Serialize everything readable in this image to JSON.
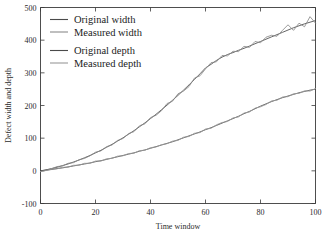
{
  "chart_data": {
    "type": "line",
    "title": "",
    "xlabel": "Time window",
    "ylabel": "Defect width and depth",
    "xlim": [
      0,
      100
    ],
    "ylim": [
      -100,
      500
    ],
    "xticks": [
      0,
      20,
      40,
      60,
      80,
      100
    ],
    "yticks": [
      -100,
      0,
      100,
      200,
      300,
      400,
      500
    ],
    "grid": false,
    "legend_position": "upper-left",
    "series": [
      {
        "name": "Original width",
        "color": "#4a4a4a",
        "x": [
          0,
          2,
          4,
          6,
          8,
          10,
          12,
          14,
          16,
          18,
          20,
          22,
          24,
          26,
          28,
          30,
          32,
          34,
          36,
          38,
          40,
          42,
          44,
          46,
          48,
          50,
          52,
          54,
          56,
          58,
          60,
          62,
          64,
          66,
          68,
          70,
          72,
          74,
          76,
          78,
          80,
          82,
          84,
          86,
          88,
          90,
          92,
          94,
          96,
          98,
          100
        ],
        "values": [
          0,
          3,
          7,
          11,
          16,
          21,
          27,
          33,
          40,
          47,
          55,
          63,
          72,
          81,
          91,
          101,
          112,
          123,
          135,
          147,
          160,
          173,
          187,
          201,
          216,
          231,
          247,
          263,
          280,
          297,
          315,
          326,
          338,
          348,
          356,
          362,
          369,
          375,
          382,
          389,
          396,
          403,
          410,
          417,
          424,
          431,
          438,
          444,
          450,
          455,
          460
        ]
      },
      {
        "name": "Measured width",
        "color": "#8a8a8a",
        "x": [
          0,
          2,
          4,
          6,
          8,
          10,
          12,
          14,
          16,
          18,
          20,
          22,
          24,
          26,
          28,
          30,
          32,
          34,
          36,
          38,
          40,
          42,
          44,
          46,
          48,
          50,
          52,
          54,
          56,
          58,
          60,
          62,
          64,
          66,
          68,
          70,
          72,
          74,
          76,
          78,
          80,
          82,
          84,
          86,
          88,
          90,
          92,
          94,
          96,
          98,
          100
        ],
        "values": [
          -2,
          2,
          6,
          13,
          15,
          23,
          25,
          34,
          38,
          46,
          57,
          61,
          74,
          79,
          93,
          99,
          114,
          120,
          138,
          144,
          163,
          170,
          184,
          206,
          213,
          236,
          244,
          258,
          284,
          291,
          312,
          331,
          334,
          353,
          352,
          366,
          365,
          381,
          378,
          396,
          392,
          409,
          415,
          412,
          430,
          447,
          430,
          452,
          441,
          472,
          452
        ]
      },
      {
        "name": "Original depth",
        "color": "#4a4a4a",
        "x": [
          0,
          2,
          4,
          6,
          8,
          10,
          12,
          14,
          16,
          18,
          20,
          22,
          24,
          26,
          28,
          30,
          32,
          34,
          36,
          38,
          40,
          42,
          44,
          46,
          48,
          50,
          52,
          54,
          56,
          58,
          60,
          62,
          64,
          66,
          68,
          70,
          72,
          74,
          76,
          78,
          80,
          82,
          84,
          86,
          88,
          90,
          92,
          94,
          96,
          98,
          100
        ],
        "values": [
          0,
          2,
          4,
          7,
          9,
          12,
          15,
          18,
          21,
          24,
          28,
          31,
          35,
          39,
          43,
          47,
          51,
          55,
          60,
          64,
          69,
          74,
          79,
          84,
          89,
          95,
          101,
          107,
          113,
          119,
          126,
          132,
          139,
          146,
          153,
          160,
          167,
          175,
          182,
          190,
          198,
          205,
          212,
          218,
          224,
          229,
          234,
          239,
          243,
          247,
          250
        ]
      },
      {
        "name": "Measured depth",
        "color": "#9a9a9a",
        "x": [
          0,
          2,
          4,
          6,
          8,
          10,
          12,
          14,
          16,
          18,
          20,
          22,
          24,
          26,
          28,
          30,
          32,
          34,
          36,
          38,
          40,
          42,
          44,
          46,
          48,
          50,
          52,
          54,
          56,
          58,
          60,
          62,
          64,
          66,
          68,
          70,
          72,
          74,
          76,
          78,
          80,
          82,
          84,
          86,
          88,
          90,
          92,
          94,
          96,
          98,
          100
        ],
        "values": [
          -2,
          1,
          5,
          6,
          11,
          11,
          17,
          17,
          23,
          23,
          30,
          30,
          37,
          38,
          45,
          46,
          53,
          54,
          62,
          63,
          71,
          73,
          80,
          83,
          91,
          93,
          103,
          105,
          115,
          117,
          128,
          130,
          141,
          148,
          151,
          162,
          165,
          177,
          180,
          192,
          196,
          203,
          214,
          216,
          226,
          227,
          236,
          237,
          245,
          244,
          252
        ]
      }
    ]
  },
  "axes": {
    "x_title": "Time window",
    "y_title": "Defect width and depth",
    "x_tick_labels": [
      "0",
      "20",
      "40",
      "60",
      "80",
      "100"
    ],
    "y_tick_labels": [
      "-100",
      "0",
      "100",
      "200",
      "300",
      "400",
      "500"
    ]
  },
  "legend": {
    "entries": [
      {
        "label": "Original width",
        "color": "#4a4a4a"
      },
      {
        "label": "Measured width",
        "color": "#8a8a8a"
      },
      {
        "label": "Original depth",
        "color": "#4a4a4a"
      },
      {
        "label": "Measured depth",
        "color": "#9a9a9a"
      }
    ]
  }
}
